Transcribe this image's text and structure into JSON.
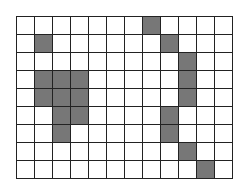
{
  "grid": {
    "rows": 9,
    "cols": 12,
    "fill_color": "#777777",
    "empty_color": "#ffffff",
    "line_color": "#222222",
    "filled_cells": [
      [
        0,
        7
      ],
      [
        1,
        1
      ],
      [
        1,
        8
      ],
      [
        2,
        9
      ],
      [
        3,
        1
      ],
      [
        3,
        2
      ],
      [
        3,
        3
      ],
      [
        3,
        9
      ],
      [
        4,
        1
      ],
      [
        4,
        2
      ],
      [
        4,
        3
      ],
      [
        4,
        9
      ],
      [
        5,
        2
      ],
      [
        5,
        3
      ],
      [
        5,
        8
      ],
      [
        6,
        2
      ],
      [
        6,
        8
      ],
      [
        7,
        9
      ],
      [
        8,
        10
      ]
    ]
  }
}
